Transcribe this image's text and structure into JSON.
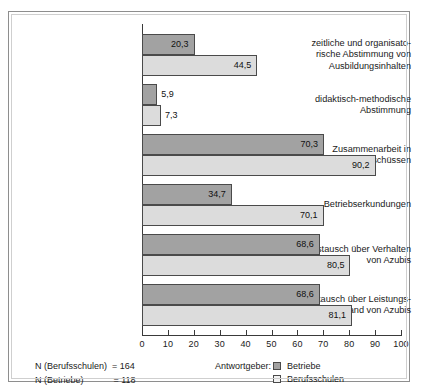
{
  "chart_data": {
    "type": "bar",
    "orientation": "horizontal",
    "title": "",
    "xlabel": "",
    "ylabel": "",
    "xlim": [
      0,
      100
    ],
    "xticks": [
      0,
      10,
      20,
      30,
      40,
      50,
      60,
      70,
      80,
      90,
      100
    ],
    "grid": false,
    "legend_position": "bottom-center",
    "legend_title": "Antwortgeber:",
    "categories": [
      "zeitliche und organisato-\nrische Abstimmung von\nAusbildungsinhalten",
      "didaktisch-methodische\nAbstimmung",
      "Zusammenarbeit in\nPrüfungsausschüssen",
      "Betriebserkundungen",
      "Austausch über Verhalten\nvon Azubis",
      "Austausch über Leistungs-\nstand von Azubis"
    ],
    "series": [
      {
        "name": "Betriebe",
        "color": "#a2a2a2",
        "values": [
          20.3,
          5.9,
          70.3,
          34.7,
          68.6,
          68.6
        ],
        "labels": [
          "20,3",
          "5,9",
          "70,3",
          "34,7",
          "68,6",
          "68,6"
        ]
      },
      {
        "name": "Berufsschulen",
        "color": "#dcdcdc",
        "values": [
          44.5,
          7.3,
          90.2,
          70.1,
          80.5,
          81.1
        ],
        "labels": [
          "44,5",
          "7,3",
          "90,2",
          "70,1",
          "80,5",
          "81,1"
        ]
      }
    ],
    "tick_labels": [
      "0",
      "10",
      "20",
      "30",
      "40",
      "50",
      "60",
      "70",
      "80",
      "90",
      "100"
    ]
  },
  "footer": {
    "note_line_1": "N (Berufsschulen)  = 164",
    "note_line_2": "N (Betriebe)            = 118"
  }
}
